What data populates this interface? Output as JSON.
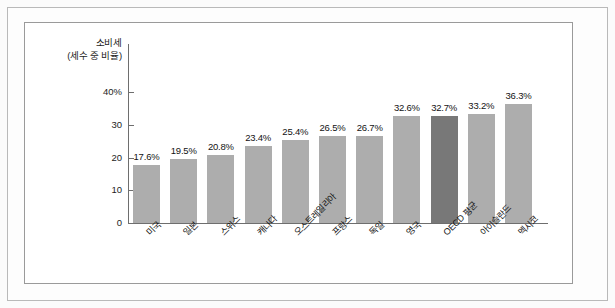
{
  "chart_data": {
    "type": "bar",
    "title": "",
    "ylabel_lines": [
      "소비세",
      "(세수 중 비율)"
    ],
    "xlabel": "",
    "ylim": [
      0,
      40
    ],
    "ytick_labels": [
      "40%",
      "30",
      "20",
      "10",
      "0"
    ],
    "ytick_values": [
      40,
      30,
      20,
      10,
      0
    ],
    "grid": false,
    "legend": "none",
    "categories": [
      "미국",
      "일본",
      "스위스",
      "캐나다",
      "오스트레일리아",
      "프랑스",
      "독일",
      "영국",
      "OECD 평균",
      "아이슬란드",
      "멕시코"
    ],
    "values": [
      17.6,
      19.5,
      20.8,
      23.4,
      25.4,
      26.5,
      26.7,
      32.6,
      32.7,
      33.2,
      36.3
    ],
    "value_labels": [
      "17.6%",
      "19.5%",
      "20.8%",
      "23.4%",
      "25.4%",
      "26.5%",
      "26.7%",
      "32.6%",
      "32.7%",
      "33.2%",
      "36.3%"
    ],
    "highlight_index": 8,
    "colors": {
      "bar": "#adadad",
      "bar_highlight": "#787878",
      "axis": "#6e6e6e",
      "text": "#131313",
      "frame": "#9a9a9a",
      "outer_frame": "#b9b9b9",
      "background": "#ffffff",
      "page_background": "#fbfbfb"
    }
  }
}
